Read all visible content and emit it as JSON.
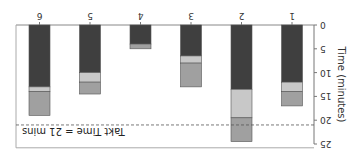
{
  "chart_data": {
    "type": "bar",
    "stacked": true,
    "orientation": "rotated-180",
    "title": "",
    "xlabel": "",
    "ylabel": "Time (minutes)",
    "ylim": [
      0,
      25
    ],
    "yticks": [
      0,
      5,
      10,
      15,
      20,
      25
    ],
    "categories": [
      "1",
      "2",
      "3",
      "4",
      "5",
      "6"
    ],
    "series": [
      {
        "name": "segment-dark",
        "color": "#3f3f3f",
        "values": [
          12,
          13.5,
          6.5,
          4,
          10,
          13
        ]
      },
      {
        "name": "segment-light",
        "color": "#c8c8c8",
        "values": [
          2,
          6,
          1.5,
          0,
          2,
          1
        ]
      },
      {
        "name": "segment-mid",
        "color": "#a0a0a0",
        "values": [
          3,
          5,
          5,
          1,
          2.5,
          5
        ]
      }
    ],
    "reference_line": {
      "value": 21,
      "label": "Takt Time = 21 mins",
      "style": "dashed"
    },
    "grid": false,
    "legend": "none"
  },
  "labels": {
    "axis_title": "Time (minutes)",
    "takt": "Takt Time = 21 mins"
  }
}
